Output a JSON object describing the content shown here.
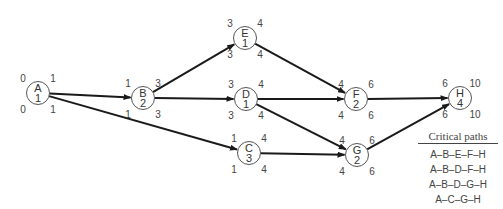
{
  "nodes": [
    {
      "id": "A",
      "duration": "1",
      "cx": 38,
      "cy": 93,
      "es": "0",
      "ef": "1",
      "ls": "0",
      "lf": "1"
    },
    {
      "id": "B",
      "duration": "2",
      "cx": 143,
      "cy": 98,
      "es": "1",
      "ef": "3",
      "ls": "1",
      "lf": "3"
    },
    {
      "id": "E",
      "duration": "1",
      "cx": 245,
      "cy": 38,
      "es": "3",
      "ef": "4",
      "ls": "3",
      "lf": "4"
    },
    {
      "id": "D",
      "duration": "1",
      "cx": 246,
      "cy": 99,
      "es": "3",
      "ef": "4",
      "ls": "3",
      "lf": "4"
    },
    {
      "id": "C",
      "duration": "3",
      "cx": 249,
      "cy": 153,
      "es": "1",
      "ef": "4",
      "ls": "1",
      "lf": "4"
    },
    {
      "id": "F",
      "duration": "2",
      "cx": 356,
      "cy": 99,
      "es": "4",
      "ef": "6",
      "ls": "4",
      "lf": "6"
    },
    {
      "id": "G",
      "duration": "2",
      "cx": 357,
      "cy": 155,
      "es": "4",
      "ef": "6",
      "ls": "4",
      "lf": "6"
    },
    {
      "id": "H",
      "duration": "4",
      "cx": 460,
      "cy": 98,
      "es": "6",
      "ef": "10",
      "ls": "6",
      "lf": "10"
    }
  ],
  "edges": [
    [
      "A",
      "B"
    ],
    [
      "A",
      "C"
    ],
    [
      "B",
      "E"
    ],
    [
      "B",
      "D"
    ],
    [
      "E",
      "F"
    ],
    [
      "D",
      "F"
    ],
    [
      "D",
      "G"
    ],
    [
      "C",
      "G"
    ],
    [
      "F",
      "H"
    ],
    [
      "G",
      "H"
    ]
  ],
  "legend": {
    "title": "Critical paths",
    "items": [
      "A–B–E–F–H",
      "A–B–D–F–H",
      "A–B–D–G–H",
      "A–C–G–H"
    ]
  }
}
